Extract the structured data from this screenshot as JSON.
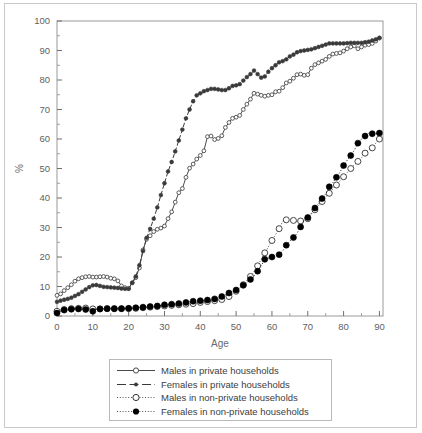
{
  "figure": {
    "background": "#ffffff",
    "frame_color": "#c9c9c9"
  },
  "chart_data": {
    "type": "line",
    "title": "",
    "subtitle": "",
    "xlabel": "Age",
    "ylabel": "%",
    "xlim": [
      0,
      91
    ],
    "ylim": [
      0,
      100
    ],
    "xticks": [
      0,
      10,
      20,
      30,
      40,
      50,
      60,
      70,
      80,
      90
    ],
    "yticks": [
      0,
      10,
      20,
      30,
      40,
      50,
      60,
      70,
      80,
      90,
      100
    ],
    "xtick_labels": [
      "0",
      "10",
      "20",
      "30",
      "40",
      "50",
      "60",
      "70",
      "80",
      "90"
    ],
    "ytick_labels": [
      "0",
      "10",
      "20",
      "30",
      "40",
      "50",
      "60",
      "70",
      "80",
      "90",
      "100"
    ],
    "grid": false,
    "legend_position": "below-center",
    "minor_ticks_x": 5,
    "minor_ticks_y": 5,
    "x": [
      0,
      1,
      2,
      3,
      4,
      5,
      6,
      7,
      8,
      9,
      10,
      11,
      12,
      13,
      14,
      15,
      16,
      17,
      18,
      19,
      20,
      21,
      22,
      23,
      24,
      25,
      26,
      27,
      28,
      29,
      30,
      31,
      32,
      33,
      34,
      35,
      36,
      37,
      38,
      39,
      40,
      41,
      42,
      43,
      44,
      45,
      46,
      47,
      48,
      49,
      50,
      51,
      52,
      53,
      54,
      55,
      56,
      57,
      58,
      59,
      60,
      61,
      62,
      63,
      64,
      65,
      66,
      67,
      68,
      69,
      70,
      71,
      72,
      73,
      74,
      75,
      76,
      77,
      78,
      79,
      80,
      81,
      82,
      83,
      84,
      85,
      86,
      87,
      88,
      89,
      90
    ],
    "series": [
      {
        "name": "Males in private households",
        "key": "males_private",
        "line_style": "solid",
        "marker": "open-circle-small",
        "color": "#4a4a4a",
        "values": [
          7.0,
          7.5,
          8.6,
          9.6,
          10.6,
          11.8,
          12.6,
          13.0,
          13.3,
          13.4,
          13.2,
          13.2,
          13.3,
          13.4,
          13.2,
          12.8,
          12.6,
          11.9,
          10.2,
          9.6,
          9.4,
          11.2,
          13.0,
          16.3,
          22.4,
          26.0,
          27.2,
          28.6,
          29.4,
          29.8,
          30.5,
          33.0,
          35.3,
          38.6,
          41.8,
          43.2,
          47.0,
          50.1,
          51.5,
          53.2,
          54.4,
          56.0,
          60.8,
          61.0,
          59.8,
          60.2,
          61.1,
          63.9,
          65.6,
          67.0,
          67.4,
          68.0,
          70.0,
          71.8,
          73.5,
          75.5,
          75.2,
          74.8,
          74.5,
          74.8,
          75.0,
          76.0,
          76.2,
          77.4,
          79.0,
          79.6,
          80.6,
          81.8,
          82.0,
          81.6,
          81.8,
          84.0,
          85.2,
          85.8,
          86.4,
          87.0,
          88.0,
          88.8,
          89.0,
          89.2,
          89.8,
          90.6,
          91.2,
          91.6,
          90.6,
          91.2,
          91.8,
          92.0,
          92.4,
          93.2,
          94.2
        ]
      },
      {
        "name": "Females in private households",
        "key": "females_private",
        "line_style": "dash-dot",
        "marker": "filled-dot-small",
        "color": "#3a3a3a",
        "values": [
          4.8,
          5.2,
          5.5,
          5.8,
          6.2,
          6.8,
          7.4,
          8.2,
          9.0,
          9.8,
          10.4,
          10.5,
          10.2,
          9.9,
          9.8,
          9.7,
          9.6,
          9.5,
          9.3,
          9.2,
          9.2,
          11.3,
          13.4,
          17.2,
          22.0,
          26.5,
          29.5,
          33.0,
          36.8,
          41.0,
          45.0,
          49.0,
          52.2,
          55.8,
          59.5,
          63.2,
          67.0,
          70.0,
          72.8,
          74.8,
          75.5,
          76.2,
          76.6,
          77.0,
          77.0,
          76.8,
          76.6,
          76.6,
          77.2,
          78.0,
          78.2,
          78.6,
          79.8,
          81.0,
          82.0,
          83.2,
          82.0,
          80.8,
          81.2,
          82.8,
          84.0,
          85.0,
          86.0,
          86.4,
          87.0,
          88.0,
          88.6,
          89.4,
          89.8,
          90.0,
          90.2,
          90.4,
          90.8,
          91.2,
          91.6,
          92.0,
          92.4,
          92.4,
          92.4,
          92.4,
          92.4,
          92.5,
          92.6,
          92.6,
          92.6,
          92.6,
          92.8,
          93.0,
          93.4,
          93.8,
          94.3
        ]
      },
      {
        "name": "Males in non-private households",
        "key": "males_nonprivate",
        "line_style": "dotted",
        "marker": "open-circle-large",
        "color": "#333333",
        "values": [
          1.6,
          2.0,
          2.2,
          2.4,
          2.5,
          2.6,
          2.6,
          2.6,
          2.7,
          2.6,
          2.4,
          2.3,
          2.4,
          2.4,
          2.5,
          2.5,
          2.5,
          2.5,
          2.5,
          2.5,
          2.5,
          2.6,
          2.6,
          2.7,
          2.8,
          2.9,
          3.0,
          3.1,
          3.2,
          3.3,
          3.4,
          3.5,
          3.6,
          3.7,
          3.8,
          3.9,
          4.0,
          4.1,
          4.2,
          4.4,
          4.6,
          4.8,
          4.9,
          5.0,
          5.2,
          5.4,
          5.6,
          6.0,
          6.6,
          7.4,
          8.4,
          9.4,
          10.6,
          12.0,
          13.4,
          15.0,
          17.0,
          19.2,
          21.4,
          23.4,
          25.6,
          27.6,
          29.6,
          32.0,
          32.6,
          32.8,
          32.4,
          32.0,
          32.2,
          32.4,
          33.0,
          34.6,
          36.0,
          37.4,
          38.8,
          40.4,
          41.6,
          43.0,
          44.4,
          45.8,
          47.2,
          48.6,
          50.0,
          51.2,
          52.4,
          53.6,
          55.2,
          56.2,
          57.0,
          58.6,
          60.0
        ]
      },
      {
        "name": "Females in non-private households",
        "key": "females_nonprivate",
        "line_style": "dotted",
        "marker": "filled-circle-large",
        "color": "#000000",
        "values": [
          1.0,
          1.6,
          2.0,
          2.2,
          2.3,
          2.4,
          2.4,
          2.3,
          2.2,
          1.9,
          1.6,
          2.2,
          2.4,
          2.5,
          2.5,
          2.5,
          2.5,
          2.5,
          2.5,
          2.6,
          2.6,
          2.7,
          2.8,
          2.9,
          3.0,
          3.1,
          3.2,
          3.3,
          3.4,
          3.6,
          3.8,
          3.9,
          4.0,
          4.1,
          4.2,
          4.4,
          4.6,
          4.8,
          5.0,
          5.1,
          5.2,
          5.3,
          5.4,
          5.6,
          5.8,
          6.2,
          6.6,
          7.2,
          7.8,
          8.2,
          8.8,
          9.6,
          10.4,
          11.4,
          12.4,
          13.6,
          15.2,
          17.0,
          19.2,
          19.6,
          20.0,
          20.4,
          20.8,
          22.0,
          24.0,
          25.4,
          26.6,
          28.0,
          30.2,
          32.4,
          33.4,
          34.8,
          36.6,
          38.2,
          39.8,
          41.4,
          43.8,
          45.2,
          47.0,
          48.8,
          51.0,
          52.8,
          54.4,
          56.2,
          58.6,
          60.0,
          61.0,
          62.0,
          61.8,
          61.8,
          62.0
        ]
      }
    ]
  },
  "legend": {
    "items": [
      {
        "label": "Males in private households",
        "swatch": "solid-open-circle"
      },
      {
        "label": "Females in private households",
        "swatch": "dashdot-filled-dot"
      },
      {
        "label": "Males in non-private households",
        "swatch": "dotted-open-circle"
      },
      {
        "label": "Females in non-private households",
        "swatch": "dotted-filled-circle"
      }
    ]
  }
}
